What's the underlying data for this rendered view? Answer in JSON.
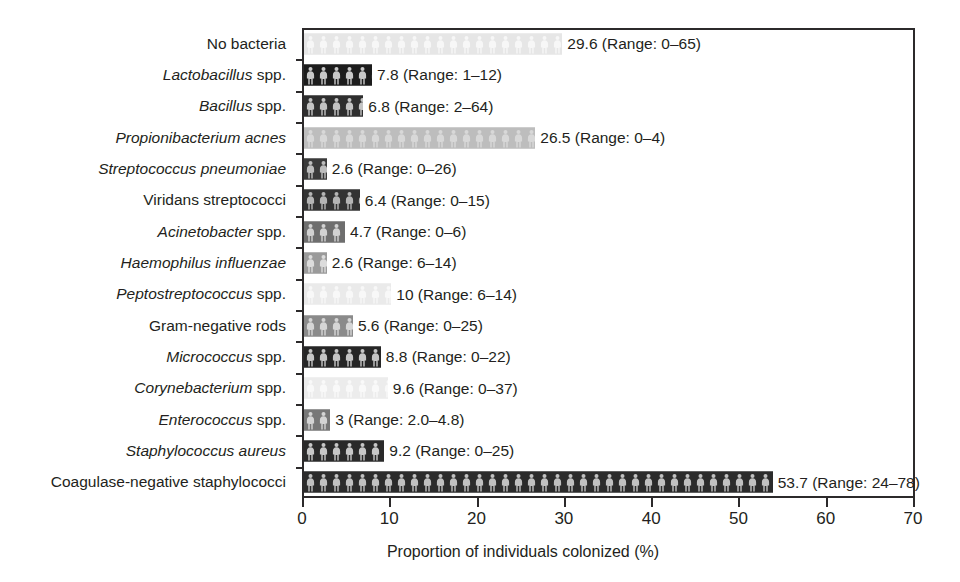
{
  "chart_data": {
    "type": "bar",
    "orientation": "horizontal",
    "title": "",
    "xlabel": "Proportion of individuals colonized (%)",
    "ylabel": "",
    "xlim": [
      0,
      70
    ],
    "xticks": [
      0,
      10,
      20,
      30,
      40,
      50,
      60,
      70
    ],
    "grid": false,
    "legend": null,
    "categories": [
      "No bacteria",
      "Lactobacillus spp.",
      "Bacillus spp.",
      "Propionibacterium acnes",
      "Streptococcus pneumoniae",
      "Viridans streptococci",
      "Acinetobacter spp.",
      "Haemophilus influenzae",
      "Peptostreptococcus spp.",
      "Gram-negative rods",
      "Micrococcus spp.",
      "Corynebacterium spp.",
      "Enterococcus spp.",
      "Staphylococcus aureus",
      "Coagulase-negative staphylococci"
    ],
    "values": [
      29.6,
      7.8,
      6.8,
      26.5,
      2.6,
      6.4,
      4.7,
      2.6,
      10,
      5.6,
      8.8,
      9.6,
      3,
      9.2,
      53.7
    ],
    "annotations": [
      "29.6 (Range: 0–65)",
      "7.8 (Range: 1–12)",
      "6.8 (Range: 2–64)",
      "26.5 (Range: 0–4)",
      "2.6 (Range: 0–26)",
      "6.4 (Range: 0–15)",
      "4.7 (Range: 0–6)",
      "2.6 (Range: 6–14)",
      "10 (Range: 6–14)",
      "5.6 (Range: 0–25)",
      "8.8 (Range: 0–22)",
      "9.6 (Range: 0–37)",
      "3 (Range: 2.0–4.8)",
      "9.2 (Range: 0–25)",
      "53.7 (Range: 24–78)"
    ]
  },
  "rows": [
    {
      "label_italic": "",
      "label_plain": "No bacteria",
      "value": 29.6,
      "annotation": "29.6 (Range: 0–65)",
      "fill": "#e6e6e6",
      "figure": "#f7f7f7"
    },
    {
      "label_italic": "Lactobacillus",
      "label_plain": " spp.",
      "value": 7.8,
      "annotation": "7.8 (Range: 1–12)",
      "fill": "#1c1c1c",
      "figure": "#c9c9c9"
    },
    {
      "label_italic": "Bacillus",
      "label_plain": " spp.",
      "value": 6.8,
      "annotation": "6.8 (Range: 2–64)",
      "fill": "#2e2e2e",
      "figure": "#c4c4c4"
    },
    {
      "label_italic": "Propionibacterium acnes",
      "label_plain": "",
      "value": 26.5,
      "annotation": "26.5 (Range: 0–4)",
      "fill": "#bdbdbd",
      "figure": "#d8d8d8"
    },
    {
      "label_italic": "Streptococcus pneumoniae",
      "label_plain": "",
      "value": 2.6,
      "annotation": "2.6 (Range: 0–26)",
      "fill": "#3a3a3a",
      "figure": "#bdbdbd"
    },
    {
      "label_italic": "",
      "label_plain": "Viridans streptococci",
      "value": 6.4,
      "annotation": "6.4 (Range: 0–15)",
      "fill": "#333333",
      "figure": "#b5b5b5"
    },
    {
      "label_italic": "Acinetobacter",
      "label_plain": " spp.",
      "value": 4.7,
      "annotation": "4.7 (Range: 0–6)",
      "fill": "#6e6e6e",
      "figure": "#d2d2d2"
    },
    {
      "label_italic": "Haemophilus influenzae",
      "label_plain": "",
      "value": 2.6,
      "annotation": "2.6 (Range: 6–14)",
      "fill": "#9a9a9a",
      "figure": "#dcdcdc"
    },
    {
      "label_italic": "Peptostreptococcus",
      "label_plain": " spp.",
      "value": 10,
      "annotation": "10 (Range: 6–14)",
      "fill": "#eaeaea",
      "figure": "#f8f8f8"
    },
    {
      "label_italic": "",
      "label_plain": "Gram-negative rods",
      "value": 5.6,
      "annotation": "5.6 (Range: 0–25)",
      "fill": "#8a8a8a",
      "figure": "#d6d6d6"
    },
    {
      "label_italic": "Micrococcus",
      "label_plain": " spp.",
      "value": 8.8,
      "annotation": "8.8 (Range: 0–22)",
      "fill": "#262626",
      "figure": "#c6c6c6"
    },
    {
      "label_italic": "Corynebacterium",
      "label_plain": " spp.",
      "value": 9.6,
      "annotation": "9.6 (Range: 0–37)",
      "fill": "#ececec",
      "figure": "#f9f9f9"
    },
    {
      "label_italic": "Enterococcus",
      "label_plain": " spp.",
      "value": 3,
      "annotation": "3 (Range: 2.0–4.8)",
      "fill": "#777777",
      "figure": "#d4d4d4"
    },
    {
      "label_italic": "Staphylococcus aureus",
      "label_plain": "",
      "value": 9.2,
      "annotation": "9.2 (Range: 0–25)",
      "fill": "#2a2a2a",
      "figure": "#c8c8c8"
    },
    {
      "label_italic": "",
      "label_plain": "Coagulase-negative staphylococci",
      "value": 53.7,
      "annotation": "53.7 (Range: 24–78)",
      "fill": "#2b2b2b",
      "figure": "#c0c0c0"
    }
  ],
  "xaxis": {
    "title": "Proportion of individuals colonized (%)",
    "ticks": [
      "0",
      "10",
      "20",
      "30",
      "40",
      "50",
      "60",
      "70"
    ],
    "min": 0,
    "max": 70
  },
  "style": {
    "axis_color": "#2c2a2b",
    "text_color": "#231f20",
    "background": "#ffffff"
  }
}
